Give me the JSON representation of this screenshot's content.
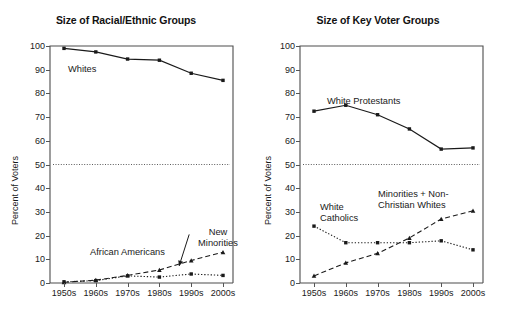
{
  "figure": {
    "background": "#ffffff",
    "ink": "#1a1a1a"
  },
  "panels": [
    {
      "id": "racial-ethnic",
      "title": "Size of Racial/Ethnic Groups",
      "ylabel": "Percent of Voters"
    },
    {
      "id": "key-voter",
      "title": "Size of Key Voter Groups",
      "ylabel": "Percent of Voters"
    }
  ],
  "annotations": {
    "whites": "Whites",
    "african_americans": "African Americans",
    "new_minorities_line1": "New",
    "new_minorities_line2": "Minorities",
    "white_protestants": "White Protestants",
    "white_catholics_line1": "White",
    "white_catholics_line2": "Catholics",
    "minorities_line1": "Minorities + Non-",
    "minorities_line2": "Christian Whites"
  },
  "chart_data": [
    {
      "type": "line",
      "title": "Size of Racial/Ethnic Groups",
      "xlabel": "",
      "ylabel": "Percent of Voters",
      "categories": [
        "1950s",
        "1960s",
        "1970s",
        "1980s",
        "1990s",
        "2000s"
      ],
      "ylim": [
        0,
        100
      ],
      "yticks": [
        0,
        10,
        20,
        30,
        40,
        50,
        60,
        70,
        80,
        90,
        100
      ],
      "grid": false,
      "legend": "none (inline labels)",
      "reference_line": {
        "value": 50,
        "style": "dotted",
        "color": "#4a4a4a"
      },
      "series": [
        {
          "name": "Whites",
          "style": "solid",
          "marker": "square",
          "color": "#1a1a1a",
          "values": [
            99,
            97.5,
            94.5,
            94,
            88.5,
            85.5
          ]
        },
        {
          "name": "African Americans",
          "style": "dotted",
          "marker": "square",
          "color": "#1a1a1a",
          "values": [
            0.5,
            1,
            3,
            2.5,
            3.8,
            3.2
          ]
        },
        {
          "name": "New Minorities",
          "style": "dashed",
          "marker": "triangle",
          "color": "#1a1a1a",
          "values": [
            0.3,
            1.2,
            3.2,
            5.5,
            9.5,
            13
          ]
        }
      ]
    },
    {
      "type": "line",
      "title": "Size of Key Voter Groups",
      "xlabel": "",
      "ylabel": "Percent of Voters",
      "categories": [
        "1950s",
        "1960s",
        "1970s",
        "1980s",
        "1990s",
        "2000s"
      ],
      "ylim": [
        0,
        100
      ],
      "yticks": [
        0,
        10,
        20,
        30,
        40,
        50,
        60,
        70,
        80,
        90,
        100
      ],
      "grid": false,
      "legend": "none (inline labels)",
      "reference_line": {
        "value": 50,
        "style": "dotted",
        "color": "#4a4a4a"
      },
      "series": [
        {
          "name": "White Protestants",
          "style": "solid",
          "marker": "square",
          "color": "#1a1a1a",
          "values": [
            72.5,
            75,
            71,
            65,
            56.5,
            57
          ]
        },
        {
          "name": "White Catholics",
          "style": "dotted",
          "marker": "square",
          "color": "#1a1a1a",
          "values": [
            24,
            17,
            17,
            17,
            17.8,
            14
          ]
        },
        {
          "name": "Minorities + Non-Christian Whites",
          "style": "dashed",
          "marker": "triangle",
          "color": "#1a1a1a",
          "values": [
            3,
            8.5,
            12.5,
            19,
            27,
            30.5
          ]
        }
      ]
    }
  ]
}
